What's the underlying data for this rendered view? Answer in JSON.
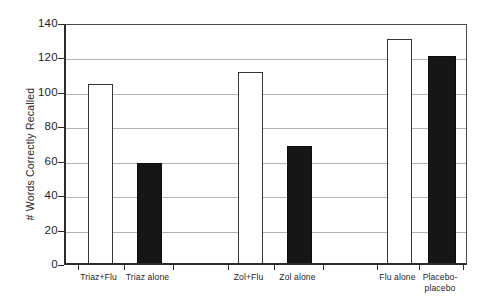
{
  "chart_data": {
    "type": "bar",
    "title": "",
    "xlabel": "",
    "ylabel": "# Words Correctly Recalled",
    "ylim": [
      0,
      140
    ],
    "ytick_values": [
      0,
      20,
      40,
      60,
      80,
      100,
      120,
      140
    ],
    "ytick_labels": [
      "0",
      "20",
      "40",
      "60",
      "80",
      "100",
      "120",
      "140"
    ],
    "grid": "horizontal",
    "legend": "none",
    "categories": [
      "Triaz+Flu",
      "Triaz alone",
      "Zol+Flu",
      "Zol alone",
      "Flu alone",
      "Placebo-\nplacebo"
    ],
    "values": [
      104,
      58,
      111,
      68,
      130,
      120
    ],
    "bar_styles": [
      "open",
      "filled",
      "open",
      "filled",
      "open",
      "filled"
    ],
    "colors": {
      "open_fill": "#ffffff",
      "open_edge": "#363636",
      "filled_fill": "#161616",
      "axis": "#2b2b2b",
      "gridline": "#b4b4b4",
      "text": "#262626"
    }
  }
}
